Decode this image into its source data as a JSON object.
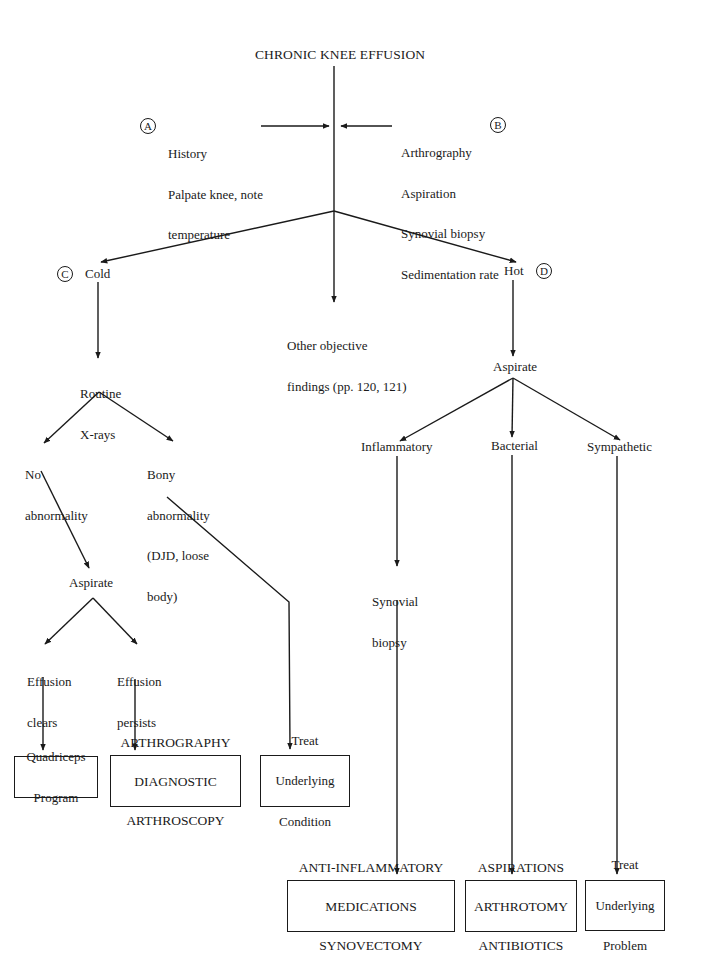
{
  "title": "CHRONIC KNEE EFFUSION",
  "badges": {
    "a": "A",
    "b": "B",
    "c": "C",
    "d": "D"
  },
  "step_a": {
    "lines": [
      "History",
      "Palpate knee, note",
      "temperature"
    ]
  },
  "step_b": {
    "lines": [
      "Arthrography",
      "Aspiration",
      "Synovial biopsy",
      "Sedimentation rate"
    ]
  },
  "cold": {
    "label": "Cold",
    "xray": [
      "Routine",
      "X-rays"
    ],
    "no_abnormality": [
      "No",
      "abnormality"
    ],
    "bony_abnormality": [
      "Bony",
      "abnormality",
      "(DJD, loose",
      "body)"
    ],
    "aspirate": "Aspirate",
    "effusion_clears": [
      "Effusion",
      "clears"
    ],
    "effusion_persists": [
      "Effusion",
      "persists"
    ],
    "outcomes": {
      "quadriceps": [
        "Quadriceps",
        "Program"
      ],
      "arthrography": [
        "ARTHROGRAPHY",
        "DIAGNOSTIC",
        "ARTHROSCOPY"
      ],
      "treat_condition": [
        "Treat",
        "Underlying",
        "Condition"
      ]
    }
  },
  "other": {
    "lines": [
      "Other objective",
      "findings (pp. 120, 121)"
    ]
  },
  "hot": {
    "label": "Hot",
    "aspirate": "Aspirate",
    "inflammatory": "Inflammatory",
    "bacterial": "Bacterial",
    "sympathetic": "Sympathetic",
    "synovial_biopsy": [
      "Synovial",
      "biopsy"
    ],
    "outcomes": {
      "anti_inflammatory": [
        "ANTI-INFLAMMATORY",
        "MEDICATIONS",
        "SYNOVECTOMY"
      ],
      "aspirations": [
        "ASPIRATIONS",
        "ARTHROTOMY",
        "ANTIBIOTICS"
      ],
      "treat_problem": [
        "Treat",
        "Underlying",
        "Problem"
      ]
    }
  },
  "colors": {
    "ink": "#1a1a1a",
    "background": "#ffffff"
  }
}
